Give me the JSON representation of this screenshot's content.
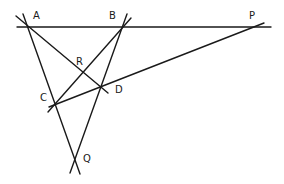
{
  "diagram": {
    "type": "geometry-construction",
    "points": {
      "A": {
        "label": "A",
        "x": 29,
        "y": 27
      },
      "B": {
        "label": "B",
        "x": 120,
        "y": 27
      },
      "C": {
        "label": "C",
        "x": 55,
        "y": 104
      },
      "D": {
        "label": "D",
        "x": 100,
        "y": 86
      },
      "R": {
        "label": "R",
        "x": 82,
        "y": 72
      },
      "P": {
        "label": "P",
        "x": 253,
        "y": 27
      },
      "Q": {
        "label": "Q",
        "x": 75,
        "y": 160
      }
    },
    "lines": [
      {
        "name": "line-ABP",
        "through": [
          "A",
          "B",
          "P"
        ]
      },
      {
        "name": "line-ACQ",
        "through": [
          "A",
          "C",
          "Q"
        ]
      },
      {
        "name": "line-BDQ",
        "through": [
          "B",
          "D",
          "Q"
        ]
      },
      {
        "name": "line-ARD",
        "through": [
          "A",
          "R",
          "D"
        ]
      },
      {
        "name": "line-BRC",
        "through": [
          "B",
          "R",
          "C"
        ]
      },
      {
        "name": "line-CDP",
        "through": [
          "C",
          "D",
          "P"
        ]
      }
    ]
  }
}
